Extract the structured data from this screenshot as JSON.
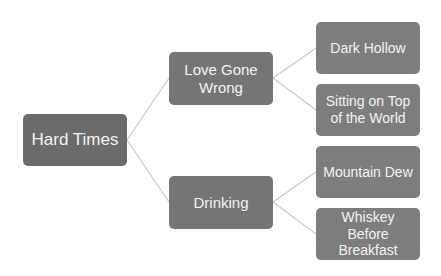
{
  "diagram": {
    "type": "horizontal-hierarchy",
    "colors": {
      "root_fill": "#6b6b6b",
      "level1_fill": "#757575",
      "level2_fill": "#7d7d7d",
      "text": "#f4f4f4",
      "connector": "#c8c8c8",
      "background": "#ffffff"
    },
    "root": {
      "label": "Hard Times",
      "children": [
        {
          "label": "Love Gone Wrong",
          "children": [
            {
              "label": "Dark Hollow"
            },
            {
              "label": "Sitting on Top of the World"
            }
          ]
        },
        {
          "label": "Drinking",
          "children": [
            {
              "label": "Mountain Dew"
            },
            {
              "label": "Whiskey Before Breakfast"
            }
          ]
        }
      ]
    }
  }
}
